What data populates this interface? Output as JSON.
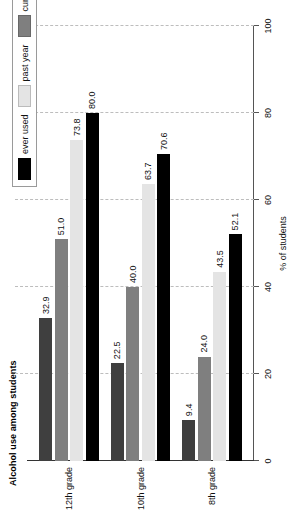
{
  "chart_data": {
    "type": "bar",
    "orientation": "horizontal",
    "title": "Alcohol use among students",
    "xlabel": "% of students",
    "ylabel": "",
    "categories": [
      "8th grade",
      "10th grade",
      "12th grade"
    ],
    "series": [
      {
        "name": "ever used",
        "color": "#000000",
        "values": [
          52.1,
          70.6,
          80.0
        ]
      },
      {
        "name": "past year",
        "color": "#e4e4e4",
        "values": [
          43.5,
          63.7,
          73.8
        ]
      },
      {
        "name": "current use",
        "color": "#7f7f7f",
        "values": [
          24.0,
          40.0,
          51.0
        ]
      },
      {
        "name": "been drunk",
        "color": "#3f3f3f",
        "values": [
          9.4,
          22.5,
          32.9
        ]
      }
    ],
    "value_labels": {
      "8th grade": [
        "52.1",
        "43.5",
        "24.0",
        "9.4"
      ],
      "10th grade": [
        "70.6",
        "63.7",
        "40.0",
        "22.5"
      ],
      "12th grade": [
        "80.0",
        "73.8",
        "51.0",
        "32.9"
      ]
    },
    "xlim": [
      0,
      100
    ],
    "xticks": [
      0,
      20,
      40,
      60,
      80,
      100
    ],
    "xtick_labels": [
      "0",
      "20",
      "40",
      "60",
      "80",
      "100"
    ],
    "grid": true,
    "grid_style": "dashed",
    "legend_position": "top-left",
    "legend_entries": [
      "ever used",
      "past year",
      "current use",
      "been drunk"
    ]
  },
  "axis": {
    "tick_labels": [
      "0",
      "20",
      "40",
      "60",
      "80",
      "100"
    ],
    "title": "% of students"
  },
  "groups": [
    {
      "label": "8th grade"
    },
    {
      "label": "10th grade"
    },
    {
      "label": "12th grade"
    }
  ],
  "legend": {
    "items": [
      {
        "label": "ever used"
      },
      {
        "label": "past year"
      },
      {
        "label": "current use"
      },
      {
        "label": "been drunk"
      }
    ]
  },
  "title": {
    "text": "Alcohol use among students"
  }
}
